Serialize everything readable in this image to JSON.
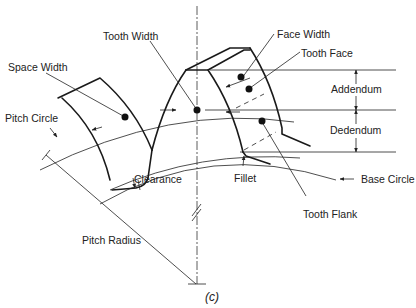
{
  "figure": {
    "caption": "(c)",
    "labels": {
      "tooth_width": "Tooth Width",
      "face_width": "Face Width",
      "tooth_face": "Tooth Face",
      "space_width": "Space Width",
      "addendum": "Addendum",
      "pitch_circle": "Pitch Circle",
      "dedendum": "Dedendum",
      "clearance": "Clearance",
      "fillet": "Fillet",
      "base_circle": "Base Circle",
      "tooth_flank": "Tooth Flank",
      "pitch_radius": "Pitch Radius"
    }
  }
}
